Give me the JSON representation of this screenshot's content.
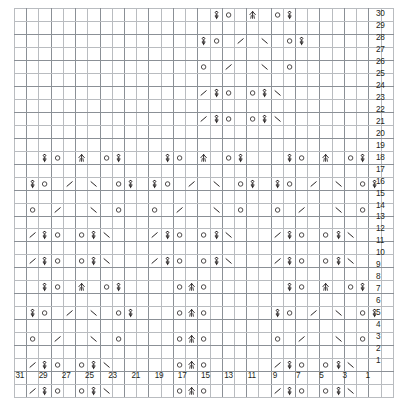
{
  "chart_data": {
    "type": "heatmap",
    "xlabel": "",
    "ylabel": "",
    "grid": true,
    "legend_position": "none",
    "columns": 31,
    "rows": 30,
    "column_numbering": "right-to-left, odd labels only",
    "row_numbering": "bottom-to-top, all labels",
    "column_labels": [
      "31",
      "",
      "29",
      "",
      "27",
      "",
      "25",
      "",
      "23",
      "",
      "21",
      "",
      "19",
      "",
      "17",
      "",
      "15",
      "",
      "13",
      "",
      "11",
      "",
      "9",
      "",
      "7",
      "",
      "5",
      "",
      "3",
      "",
      "1"
    ],
    "row_labels": [
      "30",
      "29",
      "28",
      "27",
      "26",
      "25",
      "24",
      "23",
      "22",
      "21",
      "20",
      "19",
      "18",
      "17",
      "16",
      "15",
      "14",
      "13",
      "12",
      "11",
      "10",
      "9",
      "8",
      "7",
      "6",
      "5",
      "4",
      "3",
      "2",
      "1"
    ],
    "symbol_legend": {
      "k": "knit / empty cell",
      "yo": "yarn over (circle)",
      "ssk": "slip slip knit (left-leaning decrease, forward slash)",
      "k2tog": "knit two together (right-leaning decrease, back slash)",
      "cdd": "central double decrease (up arrow)",
      "kb": "knit through back loop / twisted stitch (looped figure)"
    },
    "cells": [
      {
        "row": 30,
        "entries": [
          {
            "col": 15,
            "sym": "kb"
          },
          {
            "col": 14,
            "sym": "yo"
          },
          {
            "col": 12,
            "sym": "cdd"
          },
          {
            "col": 10,
            "sym": "yo"
          },
          {
            "col": 9,
            "sym": "kb"
          }
        ]
      },
      {
        "row": 29,
        "entries": []
      },
      {
        "row": 28,
        "entries": [
          {
            "col": 16,
            "sym": "kb"
          },
          {
            "col": 15,
            "sym": "yo"
          },
          {
            "col": 13,
            "sym": "ssk"
          },
          {
            "col": 11,
            "sym": "k2tog"
          },
          {
            "col": 9,
            "sym": "yo"
          },
          {
            "col": 8,
            "sym": "kb"
          }
        ]
      },
      {
        "row": 27,
        "entries": []
      },
      {
        "row": 26,
        "entries": [
          {
            "col": 16,
            "sym": "yo"
          },
          {
            "col": 14,
            "sym": "ssk"
          },
          {
            "col": 11,
            "sym": "k2tog"
          },
          {
            "col": 9,
            "sym": "yo"
          }
        ]
      },
      {
        "row": 25,
        "entries": []
      },
      {
        "row": 24,
        "entries": [
          {
            "col": 16,
            "sym": "ssk"
          },
          {
            "col": 15,
            "sym": "kb"
          },
          {
            "col": 14,
            "sym": "yo"
          },
          {
            "col": 12,
            "sym": "yo"
          },
          {
            "col": 11,
            "sym": "kb"
          },
          {
            "col": 10,
            "sym": "k2tog"
          }
        ]
      },
      {
        "row": 23,
        "entries": []
      },
      {
        "row": 22,
        "entries": [
          {
            "col": 16,
            "sym": "ssk"
          },
          {
            "col": 15,
            "sym": "kb"
          },
          {
            "col": 14,
            "sym": "yo"
          },
          {
            "col": 12,
            "sym": "yo"
          },
          {
            "col": 11,
            "sym": "kb"
          },
          {
            "col": 10,
            "sym": "k2tog"
          }
        ]
      },
      {
        "row": 21,
        "entries": []
      },
      {
        "row": 20,
        "entries": []
      },
      {
        "row": 19,
        "entries": [
          {
            "col": 29,
            "sym": "kb"
          },
          {
            "col": 28,
            "sym": "yo"
          },
          {
            "col": 26,
            "sym": "cdd"
          },
          {
            "col": 24,
            "sym": "yo"
          },
          {
            "col": 23,
            "sym": "kb"
          },
          {
            "col": 19,
            "sym": "kb"
          },
          {
            "col": 18,
            "sym": "yo"
          },
          {
            "col": 16,
            "sym": "cdd"
          },
          {
            "col": 14,
            "sym": "yo"
          },
          {
            "col": 13,
            "sym": "kb"
          },
          {
            "col": 9,
            "sym": "kb"
          },
          {
            "col": 8,
            "sym": "yo"
          },
          {
            "col": 6,
            "sym": "cdd"
          },
          {
            "col": 4,
            "sym": "yo"
          },
          {
            "col": 3,
            "sym": "kb"
          }
        ]
      },
      {
        "row": 18,
        "entries": []
      },
      {
        "row": 17,
        "entries": [
          {
            "col": 30,
            "sym": "kb"
          },
          {
            "col": 29,
            "sym": "yo"
          },
          {
            "col": 27,
            "sym": "ssk"
          },
          {
            "col": 25,
            "sym": "k2tog"
          },
          {
            "col": 23,
            "sym": "yo"
          },
          {
            "col": 22,
            "sym": "kb"
          },
          {
            "col": 20,
            "sym": "kb"
          },
          {
            "col": 19,
            "sym": "yo"
          },
          {
            "col": 17,
            "sym": "ssk"
          },
          {
            "col": 15,
            "sym": "k2tog"
          },
          {
            "col": 13,
            "sym": "yo"
          },
          {
            "col": 12,
            "sym": "kb"
          },
          {
            "col": 10,
            "sym": "kb"
          },
          {
            "col": 9,
            "sym": "yo"
          },
          {
            "col": 7,
            "sym": "ssk"
          },
          {
            "col": 5,
            "sym": "k2tog"
          },
          {
            "col": 3,
            "sym": "yo"
          },
          {
            "col": 2,
            "sym": "kb"
          }
        ]
      },
      {
        "row": 16,
        "entries": []
      },
      {
        "row": 15,
        "entries": [
          {
            "col": 30,
            "sym": "yo"
          },
          {
            "col": 28,
            "sym": "ssk"
          },
          {
            "col": 25,
            "sym": "k2tog"
          },
          {
            "col": 23,
            "sym": "yo"
          },
          {
            "col": 20,
            "sym": "yo"
          },
          {
            "col": 18,
            "sym": "ssk"
          },
          {
            "col": 15,
            "sym": "k2tog"
          },
          {
            "col": 13,
            "sym": "yo"
          },
          {
            "col": 10,
            "sym": "yo"
          },
          {
            "col": 8,
            "sym": "ssk"
          },
          {
            "col": 5,
            "sym": "k2tog"
          },
          {
            "col": 3,
            "sym": "yo"
          }
        ]
      },
      {
        "row": 14,
        "entries": []
      },
      {
        "row": 13,
        "entries": [
          {
            "col": 30,
            "sym": "ssk"
          },
          {
            "col": 29,
            "sym": "kb"
          },
          {
            "col": 28,
            "sym": "yo"
          },
          {
            "col": 26,
            "sym": "yo"
          },
          {
            "col": 25,
            "sym": "kb"
          },
          {
            "col": 24,
            "sym": "k2tog"
          },
          {
            "col": 20,
            "sym": "ssk"
          },
          {
            "col": 19,
            "sym": "kb"
          },
          {
            "col": 18,
            "sym": "yo"
          },
          {
            "col": 16,
            "sym": "yo"
          },
          {
            "col": 15,
            "sym": "kb"
          },
          {
            "col": 14,
            "sym": "k2tog"
          },
          {
            "col": 10,
            "sym": "ssk"
          },
          {
            "col": 9,
            "sym": "kb"
          },
          {
            "col": 8,
            "sym": "yo"
          },
          {
            "col": 6,
            "sym": "yo"
          },
          {
            "col": 5,
            "sym": "kb"
          },
          {
            "col": 4,
            "sym": "k2tog"
          }
        ]
      },
      {
        "row": 12,
        "entries": []
      },
      {
        "row": 11,
        "entries": [
          {
            "col": 30,
            "sym": "ssk"
          },
          {
            "col": 29,
            "sym": "kb"
          },
          {
            "col": 28,
            "sym": "yo"
          },
          {
            "col": 26,
            "sym": "yo"
          },
          {
            "col": 25,
            "sym": "kb"
          },
          {
            "col": 24,
            "sym": "k2tog"
          },
          {
            "col": 20,
            "sym": "ssk"
          },
          {
            "col": 19,
            "sym": "kb"
          },
          {
            "col": 18,
            "sym": "yo"
          },
          {
            "col": 16,
            "sym": "yo"
          },
          {
            "col": 15,
            "sym": "kb"
          },
          {
            "col": 14,
            "sym": "k2tog"
          },
          {
            "col": 10,
            "sym": "ssk"
          },
          {
            "col": 9,
            "sym": "kb"
          },
          {
            "col": 8,
            "sym": "yo"
          },
          {
            "col": 6,
            "sym": "yo"
          },
          {
            "col": 5,
            "sym": "kb"
          },
          {
            "col": 4,
            "sym": "k2tog"
          }
        ]
      },
      {
        "row": 10,
        "entries": []
      },
      {
        "row": 9,
        "entries": [
          {
            "col": 29,
            "sym": "kb"
          },
          {
            "col": 28,
            "sym": "yo"
          },
          {
            "col": 26,
            "sym": "cdd"
          },
          {
            "col": 24,
            "sym": "yo"
          },
          {
            "col": 23,
            "sym": "kb"
          },
          {
            "col": 18,
            "sym": "yo"
          },
          {
            "col": 17,
            "sym": "cdd"
          },
          {
            "col": 16,
            "sym": "yo"
          },
          {
            "col": 9,
            "sym": "kb"
          },
          {
            "col": 8,
            "sym": "yo"
          },
          {
            "col": 6,
            "sym": "cdd"
          },
          {
            "col": 4,
            "sym": "yo"
          },
          {
            "col": 3,
            "sym": "kb"
          }
        ]
      },
      {
        "row": 8,
        "entries": []
      },
      {
        "row": 7,
        "entries": [
          {
            "col": 30,
            "sym": "kb"
          },
          {
            "col": 29,
            "sym": "yo"
          },
          {
            "col": 27,
            "sym": "ssk"
          },
          {
            "col": 25,
            "sym": "k2tog"
          },
          {
            "col": 23,
            "sym": "yo"
          },
          {
            "col": 22,
            "sym": "kb"
          },
          {
            "col": 18,
            "sym": "yo"
          },
          {
            "col": 17,
            "sym": "cdd"
          },
          {
            "col": 16,
            "sym": "yo"
          },
          {
            "col": 10,
            "sym": "kb"
          },
          {
            "col": 9,
            "sym": "yo"
          },
          {
            "col": 7,
            "sym": "ssk"
          },
          {
            "col": 5,
            "sym": "k2tog"
          },
          {
            "col": 3,
            "sym": "yo"
          },
          {
            "col": 2,
            "sym": "kb"
          }
        ]
      },
      {
        "row": 6,
        "entries": []
      },
      {
        "row": 5,
        "entries": [
          {
            "col": 30,
            "sym": "yo"
          },
          {
            "col": 28,
            "sym": "ssk"
          },
          {
            "col": 25,
            "sym": "k2tog"
          },
          {
            "col": 23,
            "sym": "yo"
          },
          {
            "col": 18,
            "sym": "yo"
          },
          {
            "col": 17,
            "sym": "cdd"
          },
          {
            "col": 16,
            "sym": "yo"
          },
          {
            "col": 10,
            "sym": "yo"
          },
          {
            "col": 8,
            "sym": "ssk"
          },
          {
            "col": 5,
            "sym": "k2tog"
          },
          {
            "col": 3,
            "sym": "yo"
          }
        ]
      },
      {
        "row": 4,
        "entries": []
      },
      {
        "row": 3,
        "entries": [
          {
            "col": 30,
            "sym": "ssk"
          },
          {
            "col": 29,
            "sym": "kb"
          },
          {
            "col": 28,
            "sym": "yo"
          },
          {
            "col": 26,
            "sym": "yo"
          },
          {
            "col": 25,
            "sym": "kb"
          },
          {
            "col": 24,
            "sym": "k2tog"
          },
          {
            "col": 18,
            "sym": "yo"
          },
          {
            "col": 17,
            "sym": "cdd"
          },
          {
            "col": 16,
            "sym": "yo"
          },
          {
            "col": 10,
            "sym": "ssk"
          },
          {
            "col": 9,
            "sym": "kb"
          },
          {
            "col": 8,
            "sym": "yo"
          },
          {
            "col": 6,
            "sym": "yo"
          },
          {
            "col": 5,
            "sym": "kb"
          },
          {
            "col": 4,
            "sym": "k2tog"
          }
        ]
      },
      {
        "row": 2,
        "entries": []
      },
      {
        "row": 1,
        "entries": [
          {
            "col": 30,
            "sym": "ssk"
          },
          {
            "col": 29,
            "sym": "kb"
          },
          {
            "col": 28,
            "sym": "yo"
          },
          {
            "col": 26,
            "sym": "yo"
          },
          {
            "col": 25,
            "sym": "kb"
          },
          {
            "col": 24,
            "sym": "k2tog"
          },
          {
            "col": 18,
            "sym": "yo"
          },
          {
            "col": 17,
            "sym": "cdd"
          },
          {
            "col": 16,
            "sym": "yo"
          },
          {
            "col": 10,
            "sym": "ssk"
          },
          {
            "col": 9,
            "sym": "kb"
          },
          {
            "col": 8,
            "sym": "yo"
          },
          {
            "col": 6,
            "sym": "yo"
          },
          {
            "col": 5,
            "sym": "kb"
          },
          {
            "col": 4,
            "sym": "k2tog"
          }
        ]
      }
    ]
  },
  "style": {
    "grid_line_color": "#b9bcc0",
    "grid_heavy_color": "#8b9096",
    "symbol_color": "#231f20",
    "label_color": "#231f20",
    "background": "#ffffff"
  }
}
